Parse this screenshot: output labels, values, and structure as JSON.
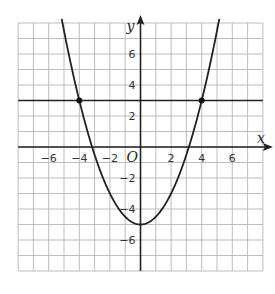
{
  "chart_data": {
    "type": "line",
    "title": "",
    "xlabel": "x",
    "ylabel": "y",
    "origin_label": "O",
    "xlim": [
      -8,
      8
    ],
    "ylim": [
      -8,
      8
    ],
    "grid": true,
    "grid_step": 1,
    "x_ticks": [
      -6,
      -4,
      -2,
      2,
      4,
      6
    ],
    "y_ticks": [
      6,
      4,
      2,
      -2,
      -4,
      -6
    ],
    "x_tick_labels": [
      "−6",
      "−4",
      "−2",
      "2",
      "4",
      "6"
    ],
    "y_tick_labels": [
      "6",
      "4",
      "2",
      "−2",
      "−4",
      "−6"
    ],
    "series": [
      {
        "name": "parabola",
        "equation": "y = 0.5x^2 - 5",
        "a": 0.5,
        "b": 0,
        "c": -5,
        "vertex": [
          0,
          -5
        ],
        "x_intercepts": [
          -3.16,
          3.16
        ],
        "color": "#222222"
      },
      {
        "name": "horizontal line",
        "equation": "y = 3",
        "y": 3,
        "color": "#222222"
      }
    ],
    "points": [
      {
        "x": -4,
        "y": 3
      },
      {
        "x": 4,
        "y": 3
      }
    ],
    "colors": {
      "grid": "#bdbdbd",
      "axis": "#222222",
      "curve": "#222222",
      "background": "#ffffff"
    }
  }
}
